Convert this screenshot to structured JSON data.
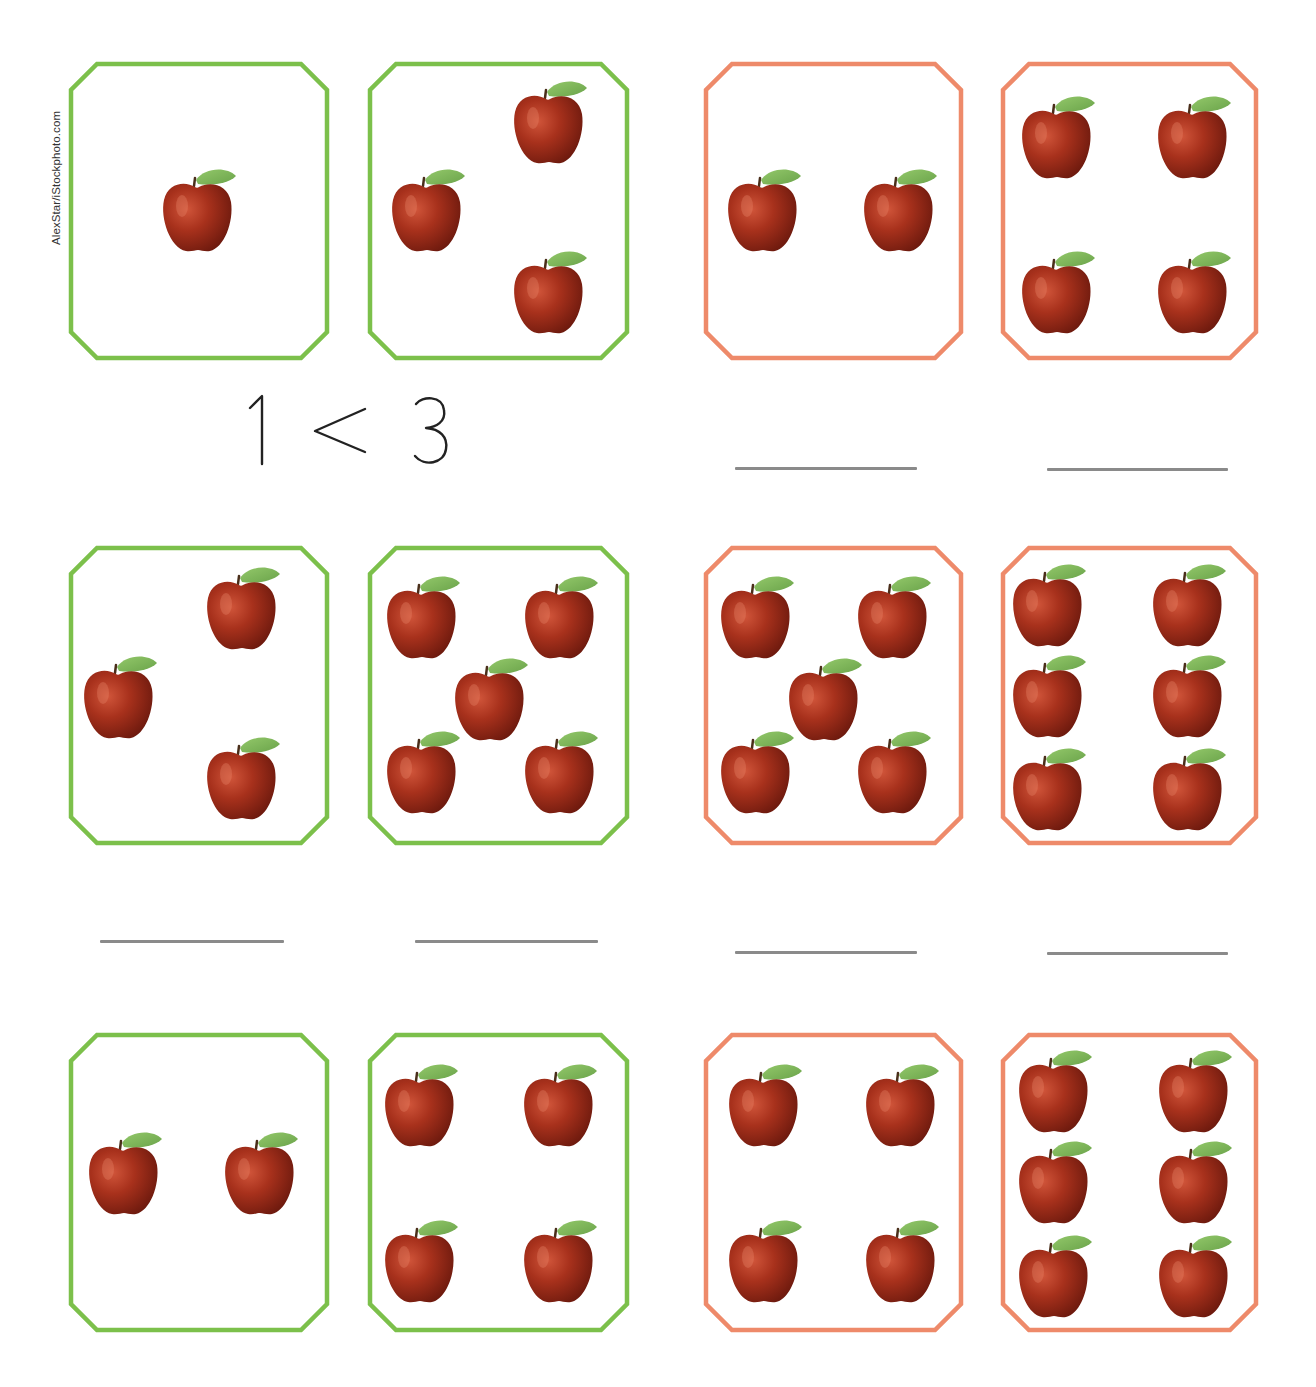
{
  "credit": "AlexStar/iStockphoto.com",
  "colors": {
    "green_frame": "#7cc04b",
    "orange_frame": "#ee8a6a",
    "answer_line": "#8a8a8a",
    "apple": "#a8311c",
    "leaf": "#7fb85a"
  },
  "example_comparison": {
    "left": "1",
    "symbol": "<",
    "right": "3"
  },
  "cards": [
    {
      "id": "r1c1",
      "row": 1,
      "col": 1,
      "frame_color": "green",
      "apple_count": 1,
      "x": 69,
      "y": 62,
      "w": 260,
      "h": 298,
      "apples": [
        [
          198,
          218
        ]
      ]
    },
    {
      "id": "r1c2",
      "row": 1,
      "col": 2,
      "frame_color": "green",
      "apple_count": 3,
      "x": 368,
      "y": 62,
      "w": 261,
      "h": 298,
      "apples": [
        [
          549,
          130
        ],
        [
          427,
          218
        ],
        [
          549,
          300
        ]
      ]
    },
    {
      "id": "r1c3",
      "row": 1,
      "col": 3,
      "frame_color": "orange",
      "apple_count": 2,
      "x": 704,
      "y": 62,
      "w": 259,
      "h": 298,
      "apples": [
        [
          763,
          218
        ],
        [
          899,
          218
        ]
      ]
    },
    {
      "id": "r1c4",
      "row": 1,
      "col": 4,
      "frame_color": "orange",
      "apple_count": 4,
      "x": 1001,
      "y": 62,
      "w": 257,
      "h": 298,
      "apples": [
        [
          1057,
          145
        ],
        [
          1193,
          145
        ],
        [
          1057,
          300
        ],
        [
          1193,
          300
        ]
      ]
    },
    {
      "id": "r2c1",
      "row": 2,
      "col": 1,
      "frame_color": "green",
      "apple_count": 3,
      "x": 69,
      "y": 546,
      "w": 260,
      "h": 299,
      "apples": [
        [
          242,
          616
        ],
        [
          119,
          705
        ],
        [
          242,
          786
        ]
      ]
    },
    {
      "id": "r2c2",
      "row": 2,
      "col": 2,
      "frame_color": "green",
      "apple_count": 5,
      "x": 368,
      "y": 546,
      "w": 261,
      "h": 299,
      "apples": [
        [
          422,
          625
        ],
        [
          560,
          625
        ],
        [
          490,
          707
        ],
        [
          422,
          780
        ],
        [
          560,
          780
        ]
      ]
    },
    {
      "id": "r2c3",
      "row": 2,
      "col": 3,
      "frame_color": "orange",
      "apple_count": 5,
      "x": 704,
      "y": 546,
      "w": 259,
      "h": 299,
      "apples": [
        [
          756,
          625
        ],
        [
          893,
          625
        ],
        [
          824,
          707
        ],
        [
          756,
          780
        ],
        [
          893,
          780
        ]
      ]
    },
    {
      "id": "r2c4",
      "row": 2,
      "col": 4,
      "frame_color": "orange",
      "apple_count": 6,
      "x": 1001,
      "y": 546,
      "w": 257,
      "h": 299,
      "apples": [
        [
          1048,
          613
        ],
        [
          1188,
          613
        ],
        [
          1048,
          704
        ],
        [
          1188,
          704
        ],
        [
          1048,
          797
        ],
        [
          1188,
          797
        ]
      ]
    },
    {
      "id": "r3c1",
      "row": 3,
      "col": 1,
      "frame_color": "green",
      "apple_count": 2,
      "x": 69,
      "y": 1033,
      "w": 260,
      "h": 299,
      "apples": [
        [
          124,
          1181
        ],
        [
          260,
          1181
        ]
      ]
    },
    {
      "id": "r3c2",
      "row": 3,
      "col": 2,
      "frame_color": "green",
      "apple_count": 4,
      "x": 368,
      "y": 1033,
      "w": 261,
      "h": 299,
      "apples": [
        [
          420,
          1113
        ],
        [
          559,
          1113
        ],
        [
          420,
          1269
        ],
        [
          559,
          1269
        ]
      ]
    },
    {
      "id": "r3c3",
      "row": 3,
      "col": 3,
      "frame_color": "orange",
      "apple_count": 4,
      "x": 704,
      "y": 1033,
      "w": 259,
      "h": 299,
      "apples": [
        [
          764,
          1113
        ],
        [
          901,
          1113
        ],
        [
          764,
          1269
        ],
        [
          901,
          1269
        ]
      ]
    },
    {
      "id": "r3c4",
      "row": 3,
      "col": 4,
      "frame_color": "orange",
      "apple_count": 6,
      "x": 1001,
      "y": 1033,
      "w": 257,
      "h": 299,
      "apples": [
        [
          1054,
          1099
        ],
        [
          1194,
          1099
        ],
        [
          1054,
          1190
        ],
        [
          1194,
          1190
        ],
        [
          1054,
          1284
        ],
        [
          1194,
          1284
        ]
      ]
    }
  ],
  "answer_lines": [
    {
      "id": "r1-right-a",
      "x": 735,
      "y": 467,
      "w": 182
    },
    {
      "id": "r1-right-b",
      "x": 1047,
      "y": 468,
      "w": 181
    },
    {
      "id": "r2-left-a",
      "x": 100,
      "y": 940,
      "w": 184
    },
    {
      "id": "r2-left-b",
      "x": 415,
      "y": 940,
      "w": 183
    },
    {
      "id": "r2-right-a",
      "x": 735,
      "y": 951,
      "w": 182
    },
    {
      "id": "r2-right-b",
      "x": 1047,
      "y": 952,
      "w": 181
    }
  ]
}
